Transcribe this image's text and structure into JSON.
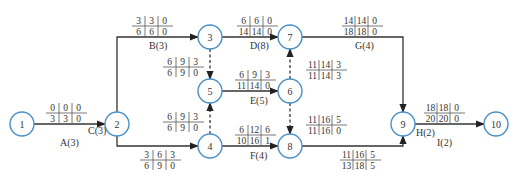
{
  "colors": {
    "node_stroke": "#4a90c8",
    "line": "#333333",
    "text": "#333333"
  },
  "nodes": [
    {
      "id": "1",
      "x": 22,
      "y": 124
    },
    {
      "id": "2",
      "x": 117,
      "y": 124
    },
    {
      "id": "3",
      "x": 210,
      "y": 37
    },
    {
      "id": "4",
      "x": 210,
      "y": 146
    },
    {
      "id": "5",
      "x": 210,
      "y": 91
    },
    {
      "id": "6",
      "x": 290,
      "y": 91
    },
    {
      "id": "7",
      "x": 290,
      "y": 37
    },
    {
      "id": "8",
      "x": 290,
      "y": 146
    },
    {
      "id": "9",
      "x": 403,
      "y": 124
    },
    {
      "id": "10",
      "x": 496,
      "y": 124
    }
  ],
  "activities": [
    {
      "name": "A(3)",
      "from": "1",
      "to": "2",
      "dummy": false,
      "top": [
        "0",
        "0",
        "0"
      ],
      "bottom": [
        "3",
        "3",
        "0"
      ],
      "table_x": 46,
      "table_y": 103,
      "label_x": 60,
      "label_y": 146
    },
    {
      "name": "B(3)",
      "from": "2",
      "to": "3",
      "dummy": false,
      "top": [
        "3",
        "3",
        "0"
      ],
      "bottom": [
        "6",
        "6",
        "0"
      ],
      "table_x": 132,
      "table_y": 16,
      "label_x": 149,
      "label_y": 49
    },
    {
      "name": "C(3)",
      "from": "2",
      "to": "4",
      "dummy": false,
      "top": [
        "3",
        "6",
        "3"
      ],
      "bottom": [
        "6",
        "9",
        "0"
      ],
      "table_x": 140,
      "table_y": 150,
      "label_x": 88,
      "label_y": 134
    },
    {
      "name": "D(8)",
      "from": "3",
      "to": "7",
      "dummy": false,
      "top": [
        "6",
        "6",
        "0"
      ],
      "bottom": [
        "14",
        "14",
        "0"
      ],
      "table_x": 237,
      "table_y": 16,
      "label_x": 250,
      "label_y": 49
    },
    {
      "name": "E(5)",
      "from": "5",
      "to": "6",
      "dummy": false,
      "top": [
        "6",
        "9",
        "3"
      ],
      "bottom": [
        "11",
        "14",
        "0"
      ],
      "table_x": 235,
      "table_y": 70,
      "label_x": 250,
      "label_y": 104
    },
    {
      "name": "F(4)",
      "from": "4",
      "to": "8",
      "dummy": false,
      "top": [
        "6",
        "12",
        "6"
      ],
      "bottom": [
        "10",
        "16",
        "1"
      ],
      "table_x": 235,
      "table_y": 125,
      "label_x": 250,
      "label_y": 159
    },
    {
      "name": "G(4)",
      "from": "7",
      "to": "9",
      "dummy": false,
      "top": [
        "14",
        "14",
        "0"
      ],
      "bottom": [
        "18",
        "18",
        "0"
      ],
      "table_x": 342,
      "table_y": 16,
      "label_x": 355,
      "label_y": 49
    },
    {
      "name": "H(2)",
      "from": "8",
      "to": "9",
      "dummy": false,
      "top": [
        "11",
        "16",
        "5"
      ],
      "bottom": [
        "13",
        "18",
        "5"
      ],
      "table_x": 340,
      "table_y": 150,
      "label_x": 416,
      "label_y": 136
    },
    {
      "name": "I(2)",
      "from": "9",
      "to": "10",
      "dummy": false,
      "top": [
        "18",
        "18",
        "0"
      ],
      "bottom": [
        "20",
        "20",
        "0"
      ],
      "table_x": 424,
      "table_y": 103,
      "label_x": 437,
      "label_y": 146
    },
    {
      "name": "",
      "from": "3",
      "to": "5",
      "dummy": true,
      "top": [
        "6",
        "9",
        "3"
      ],
      "bottom": [
        "6",
        "9",
        "0"
      ],
      "table_x": 163,
      "table_y": 57
    },
    {
      "name": "",
      "from": "4",
      "to": "5",
      "dummy": true,
      "top": [
        "6",
        "9",
        "3"
      ],
      "bottom": [
        "6",
        "9",
        "0"
      ],
      "table_x": 163,
      "table_y": 112
    },
    {
      "name": "",
      "from": "6",
      "to": "7",
      "dummy": true,
      "top": [
        "11",
        "14",
        "3"
      ],
      "bottom": [
        "11",
        "14",
        "3"
      ],
      "table_x": 306,
      "table_y": 60
    },
    {
      "name": "",
      "from": "6",
      "to": "8",
      "dummy": true,
      "top": [
        "11",
        "16",
        "5"
      ],
      "bottom": [
        "11",
        "16",
        "0"
      ],
      "table_x": 306,
      "table_y": 115
    }
  ]
}
